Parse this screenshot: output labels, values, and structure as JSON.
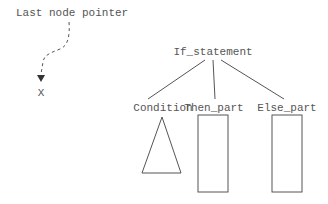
{
  "diagram": {
    "pointer": {
      "label": "Last node pointer",
      "target_label": "X"
    },
    "root": {
      "label": "If_statement",
      "children": [
        {
          "label": "Condition",
          "shape": "triangle"
        },
        {
          "label": "Then_part",
          "shape": "rectangle"
        },
        {
          "label": "Else_part",
          "shape": "rectangle"
        }
      ]
    },
    "colors": {
      "stroke": "#555555",
      "text": "#555555",
      "background": "#ffffff"
    }
  }
}
